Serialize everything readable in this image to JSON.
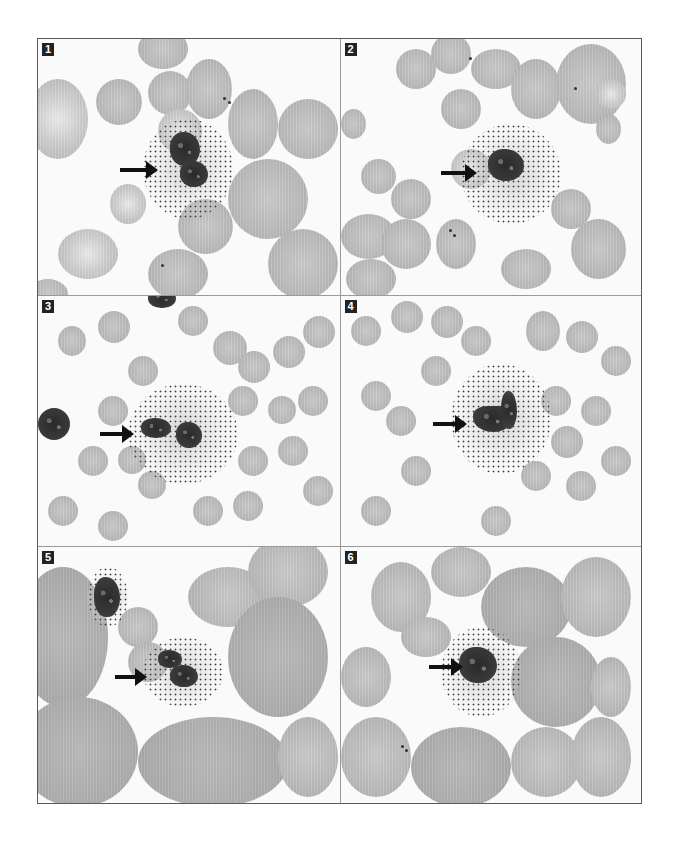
{
  "figure": {
    "type": "photomicrograph-grid",
    "layout": {
      "columns": 2,
      "rows": 3
    },
    "panels": [
      {
        "label": "1",
        "subject": "bilobed granulocyte with coarse granules",
        "arrow": "right-pointing arrow toward cell"
      },
      {
        "label": "2",
        "subject": "granulocyte with dense granular cytoplasm",
        "arrow": "right-pointing arrow toward cell"
      },
      {
        "label": "3",
        "subject": "granulocyte with scattered granules; adjacent dark leukocyte at left edge",
        "arrow": "right-pointing arrow toward cell"
      },
      {
        "label": "4",
        "subject": "granulocyte with curved/band nucleus and granules",
        "arrow": "right-pointing arrow toward cell"
      },
      {
        "label": "5",
        "subject": "bilobed granulocyte; second dark leukocyte upper left",
        "arrow": "right-pointing arrow toward cell"
      },
      {
        "label": "6",
        "subject": "granulocyte with dense dark nucleus",
        "arrow": "right-pointing arrow toward cell"
      }
    ]
  },
  "colors": {
    "border": "#5a5a5a",
    "divider": "#9a9a9a",
    "label_bg": "#222222",
    "label_text": "#ffffff",
    "rbc": "#b6b6b6",
    "nucleus": "#2a2a2a",
    "arrow": "#111111"
  }
}
